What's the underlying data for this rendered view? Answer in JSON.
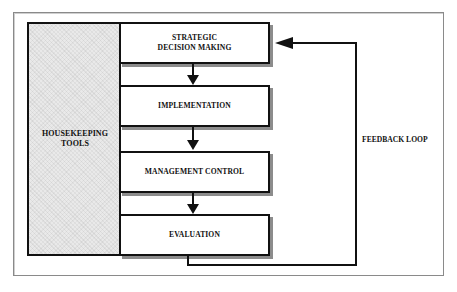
{
  "diagram": {
    "side_panel": {
      "label": "HOUSEKEEPING\nTOOLS",
      "fill": "#e9e9e9"
    },
    "steps": [
      {
        "label": "STRATEGIC\nDECISION MAKING"
      },
      {
        "label": "IMPLEMENTATION"
      },
      {
        "label": "MANAGEMENT CONTROL"
      },
      {
        "label": "EVALUATION"
      }
    ],
    "feedback": {
      "label": "FEEDBACK LOOP",
      "from": "EVALUATION",
      "to": "STRATEGIC DECISION MAKING"
    },
    "colors": {
      "stroke": "#111111",
      "shadow": "#8c8c8c",
      "frame": "#8a8a8a",
      "background": "#ffffff"
    }
  }
}
